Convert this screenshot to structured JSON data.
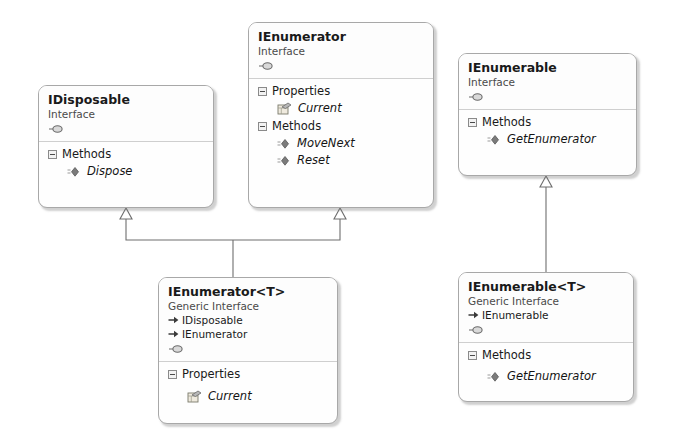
{
  "diagram": {
    "type": "uml-class-diagram",
    "background_color": "#ffffff",
    "box_border_color": "#a8a8a8",
    "box_fill_color": "#fefefe",
    "connector_color": "#6e6e6e"
  },
  "labels": {
    "properties": "Properties",
    "methods": "Methods"
  },
  "boxes": [
    {
      "id": "idisposable",
      "title": "IDisposable",
      "stereotype": "Interface",
      "bases": [],
      "sections": [
        {
          "name": "Methods",
          "kind": "method",
          "members": [
            {
              "name": "Dispose",
              "icon": "method-icon"
            }
          ]
        }
      ]
    },
    {
      "id": "ienumerator",
      "title": "IEnumerator",
      "stereotype": "Interface",
      "bases": [],
      "sections": [
        {
          "name": "Properties",
          "kind": "property",
          "members": [
            {
              "name": "Current",
              "icon": "property-icon"
            }
          ]
        },
        {
          "name": "Methods",
          "kind": "method",
          "members": [
            {
              "name": "MoveNext",
              "icon": "method-icon"
            },
            {
              "name": "Reset",
              "icon": "method-icon"
            }
          ]
        }
      ]
    },
    {
      "id": "ienumerable",
      "title": "IEnumerable",
      "stereotype": "Interface",
      "bases": [],
      "sections": [
        {
          "name": "Methods",
          "kind": "method",
          "members": [
            {
              "name": "GetEnumerator",
              "icon": "method-icon"
            }
          ]
        }
      ]
    },
    {
      "id": "ienumerator-t",
      "title": "IEnumerator<T>",
      "stereotype": "Generic Interface",
      "bases": [
        {
          "name": "IDisposable",
          "icon": "base-interface-arrow-icon"
        },
        {
          "name": "IEnumerator",
          "icon": "base-interface-arrow-icon"
        }
      ],
      "sections": [
        {
          "name": "Properties",
          "kind": "property",
          "members": [
            {
              "name": "Current",
              "icon": "property-icon"
            }
          ]
        }
      ]
    },
    {
      "id": "ienumerable-t",
      "title": "IEnumerable<T>",
      "stereotype": "Generic Interface",
      "bases": [
        {
          "name": "IEnumerable",
          "icon": "base-interface-arrow-icon"
        }
      ],
      "sections": [
        {
          "name": "Methods",
          "kind": "method",
          "members": [
            {
              "name": "GetEnumerator",
              "icon": "method-icon"
            }
          ]
        }
      ]
    }
  ],
  "connections": [
    {
      "from": "ienumerator-t",
      "to": "idisposable",
      "kind": "inheritance"
    },
    {
      "from": "ienumerator-t",
      "to": "ienumerator",
      "kind": "inheritance"
    },
    {
      "from": "ienumerable-t",
      "to": "ienumerable",
      "kind": "inheritance"
    }
  ]
}
